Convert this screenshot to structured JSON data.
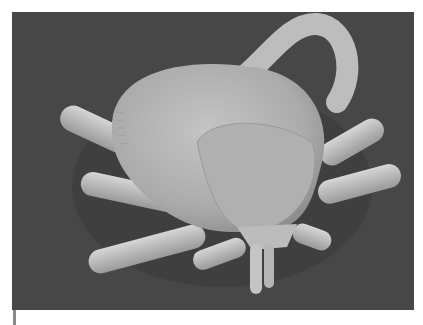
{
  "image": {
    "subject": "scanning electron micrograph of a tick",
    "background_color": "#474747",
    "body_color": "#b4b4b4",
    "leg_color": "#c2c2c2",
    "page_background": "#ffffff"
  }
}
